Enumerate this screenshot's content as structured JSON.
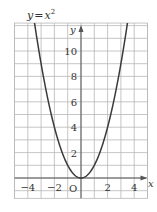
{
  "chart_data": {
    "type": "line",
    "function": "y = x^2",
    "xlabel": "x",
    "ylabel": "y",
    "origin_label": "O",
    "xlim": [
      -5,
      5
    ],
    "ylim": [
      -1.6,
      12.2
    ],
    "grid": true,
    "grid_step": 1,
    "x_ticks": [
      {
        "value": -4,
        "label": "−4"
      },
      {
        "value": -2,
        "label": "−2"
      },
      {
        "value": 2,
        "label": "2"
      },
      {
        "value": 4,
        "label": "4"
      }
    ],
    "y_ticks": [
      {
        "value": 2,
        "label": "2"
      },
      {
        "value": 4,
        "label": "4"
      },
      {
        "value": 6,
        "label": "6"
      },
      {
        "value": 8,
        "label": "8"
      },
      {
        "value": 10,
        "label": "10"
      }
    ],
    "series": [
      {
        "name": "y=x²",
        "x": [
          -3.5,
          -3,
          -2.5,
          -2,
          -1.5,
          -1,
          -0.5,
          0,
          0.5,
          1,
          1.5,
          2,
          2.5,
          3,
          3.5
        ],
        "y": [
          12.25,
          9,
          6.25,
          4,
          2.25,
          1,
          0.25,
          0,
          0.25,
          1,
          2.25,
          4,
          6.25,
          9,
          12.25
        ]
      }
    ],
    "colors": {
      "curve": "#3a3a3a",
      "grid": "#b8b8b8",
      "axis": "#555555",
      "text": "#333333"
    }
  }
}
